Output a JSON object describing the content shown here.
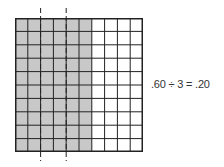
{
  "diagram": {
    "grid": {
      "rows": 10,
      "cols": 10,
      "shaded_cols": 6,
      "shade_color": "#c8c8c8",
      "line_color": "#222222"
    },
    "dividers": {
      "count": 2,
      "positions_cols": [
        2,
        4
      ],
      "style": "dashed"
    },
    "equation": ".60 ÷ 3 = .20"
  }
}
